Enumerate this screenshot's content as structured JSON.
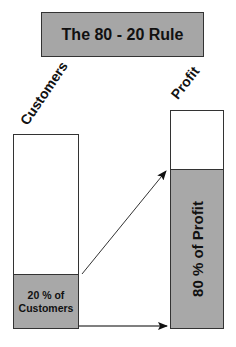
{
  "title": "The 80 - 20 Rule",
  "labels": {
    "left_axis": "Customers",
    "right_axis": "Profit"
  },
  "bars": {
    "customers": {
      "highlight_fraction": 0.2,
      "highlight_line1": "20 % of",
      "highlight_line2": "Customers"
    },
    "profit": {
      "highlight_fraction": 0.8,
      "highlight_text": "80 % of Profit"
    }
  },
  "colors": {
    "box_fill": "#a6a6a6",
    "segment_fill": "#a8a8a8",
    "stroke": "#333333"
  }
}
